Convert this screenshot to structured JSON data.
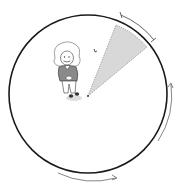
{
  "diagram": {
    "colors": {
      "background": "#ffffff",
      "circle_stroke": "#1a1a1a",
      "sector_fill": "#d8d8d8",
      "sector_stroke": "#888888",
      "arrow_stroke": "#555555",
      "figure_sweater": "#8a8a8a",
      "figure_outline": "#444444"
    },
    "elements": [
      {
        "id": "circle",
        "label": "large circle"
      },
      {
        "id": "sector",
        "label": "shaded viewing sector"
      },
      {
        "id": "bracket-arc",
        "label": "arc-length bracket"
      },
      {
        "id": "arrow-right",
        "label": "upward curved arrow on right side"
      },
      {
        "id": "arrow-bottom",
        "label": "rightward curved arrow at bottom"
      },
      {
        "id": "figure",
        "label": "cartoon scientist figure"
      },
      {
        "id": "bird",
        "label": "small bird mark"
      }
    ]
  }
}
